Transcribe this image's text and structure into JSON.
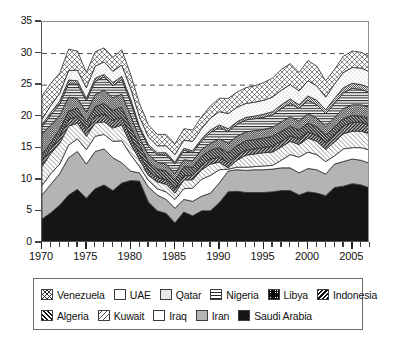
{
  "chart_data": {
    "type": "area",
    "stacked": true,
    "title": "",
    "xlabel": "",
    "ylabel": "",
    "xlim": [
      1970,
      2007
    ],
    "ylim": [
      0,
      35
    ],
    "ytick_values": [
      0,
      5,
      10,
      15,
      20,
      25,
      30,
      35
    ],
    "ytick_labels": [
      "0",
      "5",
      "10",
      "15",
      "20",
      "25",
      "30",
      "35"
    ],
    "xtick_labels": [
      "1970",
      "1975",
      "1980",
      "1985",
      "1990",
      "1995",
      "2000",
      "2005"
    ],
    "xtick_values": [
      1970,
      1975,
      1980,
      1985,
      1990,
      1995,
      2000,
      2005
    ],
    "xtick_minor_step": 1,
    "gridlines": [
      20,
      25,
      30
    ],
    "grid_style": "dashed",
    "grid_axis": "y",
    "legend_position": "below",
    "x": [
      1970,
      1971,
      1972,
      1973,
      1974,
      1975,
      1976,
      1977,
      1978,
      1979,
      1980,
      1981,
      1982,
      1983,
      1984,
      1985,
      1986,
      1987,
      1988,
      1989,
      1990,
      1991,
      1992,
      1993,
      1994,
      1995,
      1996,
      1997,
      1998,
      1999,
      2000,
      2001,
      2002,
      2003,
      2004,
      2005,
      2006,
      2007
    ],
    "series": [
      {
        "name": "Saudi Arabia",
        "fill": "solid-black",
        "color": "#151515",
        "values": [
          3.8,
          4.8,
          6.0,
          7.6,
          8.5,
          7.1,
          8.6,
          9.2,
          8.3,
          9.5,
          9.9,
          9.8,
          6.5,
          5.1,
          4.7,
          3.2,
          4.9,
          4.3,
          5.1,
          5.1,
          6.4,
          8.1,
          8.2,
          8.0,
          8.0,
          8.0,
          8.1,
          8.3,
          8.3,
          7.6,
          8.1,
          7.9,
          7.5,
          8.8,
          9.0,
          9.4,
          9.2,
          8.7
        ]
      },
      {
        "name": "Iran",
        "fill": "solid-gray",
        "color": "#b4b4b4",
        "values": [
          3.8,
          4.5,
          5.0,
          5.9,
          6.0,
          5.4,
          5.9,
          5.7,
          5.2,
          3.2,
          1.5,
          1.3,
          2.4,
          2.5,
          2.2,
          2.3,
          2.0,
          2.3,
          2.3,
          2.8,
          3.1,
          3.3,
          3.4,
          3.5,
          3.6,
          3.6,
          3.6,
          3.6,
          3.6,
          3.5,
          3.7,
          3.7,
          3.4,
          3.7,
          3.9,
          3.9,
          3.9,
          3.9
        ]
      },
      {
        "name": "Iraq",
        "fill": "white",
        "color": "#ffffff",
        "values": [
          1.5,
          1.7,
          1.5,
          2.0,
          2.0,
          2.3,
          2.4,
          2.3,
          2.6,
          3.5,
          2.6,
          1.0,
          1.0,
          1.0,
          1.2,
          1.4,
          1.7,
          2.1,
          2.7,
          2.8,
          2.1,
          0.3,
          0.4,
          0.5,
          0.5,
          0.6,
          0.6,
          1.2,
          2.1,
          2.5,
          2.6,
          2.4,
          2.0,
          1.3,
          2.0,
          1.8,
          2.0,
          2.1
        ]
      },
      {
        "name": "Kuwait",
        "fill": "sparse-backslash",
        "color": "#ffffff",
        "values": [
          3.0,
          3.2,
          3.3,
          3.0,
          2.5,
          2.1,
          2.1,
          2.0,
          2.1,
          2.5,
          1.7,
          1.1,
          0.8,
          1.1,
          1.2,
          1.0,
          1.4,
          1.3,
          1.5,
          1.8,
          1.2,
          0.2,
          1.1,
          1.9,
          2.0,
          2.1,
          2.1,
          2.1,
          2.1,
          2.0,
          2.2,
          2.1,
          1.9,
          2.2,
          2.4,
          2.6,
          2.6,
          2.6
        ]
      },
      {
        "name": "Algeria",
        "fill": "dense-slash",
        "color": "#ffffff",
        "values": [
          1.0,
          0.8,
          1.1,
          1.1,
          1.0,
          1.0,
          1.1,
          1.2,
          1.2,
          1.2,
          1.1,
          0.8,
          0.8,
          0.7,
          0.7,
          0.7,
          0.7,
          0.7,
          0.8,
          0.8,
          0.8,
          0.8,
          0.8,
          0.8,
          0.8,
          0.8,
          0.9,
          0.9,
          0.9,
          0.9,
          1.0,
          1.0,
          1.1,
          1.2,
          1.3,
          1.4,
          1.4,
          1.4
        ]
      },
      {
        "name": "Indonesia",
        "fill": "dark-backslash",
        "color": "#2a2a2a",
        "values": [
          0.9,
          0.9,
          1.1,
          1.3,
          1.4,
          1.3,
          1.5,
          1.7,
          1.6,
          1.6,
          1.6,
          1.6,
          1.3,
          1.3,
          1.4,
          1.3,
          1.4,
          1.3,
          1.3,
          1.4,
          1.5,
          1.6,
          1.5,
          1.5,
          1.5,
          1.5,
          1.6,
          1.6,
          1.5,
          1.4,
          1.4,
          1.3,
          1.2,
          1.2,
          1.1,
          1.1,
          1.0,
          1.0
        ]
      },
      {
        "name": "Libya",
        "fill": "dark-checker",
        "color": "#1e1e1e",
        "values": [
          3.3,
          2.8,
          2.2,
          2.2,
          1.5,
          1.5,
          1.9,
          2.1,
          2.0,
          2.1,
          1.8,
          1.1,
          1.2,
          1.1,
          1.1,
          1.1,
          1.1,
          1.0,
          1.1,
          1.1,
          1.4,
          1.5,
          1.5,
          1.4,
          1.4,
          1.4,
          1.4,
          1.5,
          1.5,
          1.4,
          1.5,
          1.4,
          1.4,
          1.5,
          1.6,
          1.7,
          1.8,
          1.8
        ]
      },
      {
        "name": "Nigeria",
        "fill": "horizontal-lines",
        "color": "#2b2b2b",
        "values": [
          1.1,
          1.6,
          1.8,
          2.1,
          2.3,
          1.8,
          2.1,
          2.1,
          1.9,
          2.3,
          2.1,
          1.4,
          1.3,
          1.2,
          1.4,
          1.5,
          1.5,
          1.3,
          1.4,
          1.7,
          1.8,
          1.9,
          1.9,
          1.9,
          1.9,
          1.9,
          2.0,
          2.1,
          2.1,
          2.0,
          2.1,
          2.1,
          2.0,
          2.2,
          2.5,
          2.6,
          2.4,
          2.3
        ]
      },
      {
        "name": "Qatar",
        "fill": "fine-dots",
        "color": "#d4d4d4",
        "values": [
          0.4,
          0.4,
          0.5,
          0.6,
          0.5,
          0.4,
          0.5,
          0.4,
          0.5,
          0.5,
          0.5,
          0.4,
          0.3,
          0.3,
          0.4,
          0.3,
          0.3,
          0.3,
          0.3,
          0.4,
          0.4,
          0.4,
          0.4,
          0.4,
          0.4,
          0.5,
          0.5,
          0.6,
          0.7,
          0.6,
          0.7,
          0.7,
          0.6,
          0.8,
          0.8,
          0.8,
          0.8,
          0.8
        ]
      },
      {
        "name": "UAE",
        "fill": "light-dots",
        "color": "#f2f2f2",
        "values": [
          0.8,
          1.1,
          1.2,
          1.5,
          1.7,
          1.7,
          1.9,
          2.0,
          1.8,
          1.8,
          1.7,
          1.5,
          1.2,
          1.1,
          1.1,
          1.2,
          1.3,
          1.5,
          1.6,
          1.9,
          2.1,
          2.4,
          2.3,
          2.2,
          2.2,
          2.2,
          2.3,
          2.3,
          2.3,
          2.2,
          2.4,
          2.3,
          2.0,
          2.3,
          2.4,
          2.5,
          2.6,
          2.5
        ]
      },
      {
        "name": "Venezuela",
        "fill": "crosshatch",
        "color": "#ffffff",
        "values": [
          3.7,
          3.5,
          3.2,
          3.4,
          3.0,
          2.4,
          2.3,
          2.2,
          2.2,
          2.4,
          2.2,
          2.1,
          1.9,
          1.8,
          1.8,
          1.7,
          1.8,
          1.8,
          1.9,
          1.9,
          2.1,
          2.4,
          2.4,
          2.5,
          2.6,
          2.8,
          3.0,
          3.3,
          3.3,
          2.9,
          3.2,
          3.1,
          2.6,
          2.3,
          2.6,
          2.6,
          2.5,
          2.4
        ]
      }
    ]
  },
  "legend": {
    "rows": [
      [
        {
          "label": "Venezuela",
          "swatch": "sw-venezuela"
        },
        {
          "label": "UAE",
          "swatch": "sw-uae"
        },
        {
          "label": "Qatar",
          "swatch": "sw-qatar"
        },
        {
          "label": "Nigeria",
          "swatch": "sw-nigeria"
        },
        {
          "label": "Libya",
          "swatch": "sw-libya"
        },
        {
          "label": "Indonesia",
          "swatch": "sw-indonesia"
        }
      ],
      [
        {
          "label": "Algeria",
          "swatch": "sw-algeria"
        },
        {
          "label": "Kuwait",
          "swatch": "sw-kuwait"
        },
        {
          "label": "Iraq",
          "swatch": "sw-iraq"
        },
        {
          "label": "Iran",
          "swatch": "sw-iran"
        },
        {
          "label": "Saudi Arabia",
          "swatch": "sw-saudi"
        }
      ]
    ]
  }
}
